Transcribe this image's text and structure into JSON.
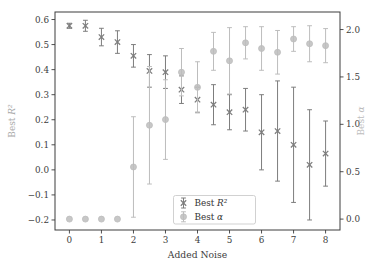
{
  "chart_data": {
    "type": "scatter",
    "style": "errorbar-dual-axis",
    "title": "",
    "xlabel": "Added Noise",
    "ylabel_left": "Best R²",
    "ylabel_right": "Best α",
    "x": [
      0,
      0.5,
      1,
      1.5,
      2,
      2.5,
      3,
      3.5,
      4,
      4.5,
      5,
      5.5,
      6,
      6.5,
      7,
      7.5,
      8
    ],
    "series": [
      {
        "name": "Best R²",
        "axis": "left",
        "marker": "x",
        "color": "#7d7d7d",
        "values": [
          0.575,
          0.575,
          0.53,
          0.51,
          0.455,
          0.395,
          0.39,
          0.32,
          0.28,
          0.26,
          0.23,
          0.24,
          0.15,
          0.155,
          0.1,
          0.02,
          0.065
        ],
        "errors": [
          0.01,
          0.022,
          0.035,
          0.045,
          0.045,
          0.065,
          0.065,
          0.055,
          0.05,
          0.08,
          0.07,
          0.085,
          0.15,
          0.2,
          0.23,
          0.22,
          0.13
        ]
      },
      {
        "name": "Best α",
        "axis": "right",
        "marker": "circle",
        "color": "#bdbdbd",
        "values": [
          0.0,
          0.0,
          0.0,
          0.0,
          0.55,
          0.99,
          1.05,
          1.55,
          1.39,
          1.77,
          1.67,
          1.86,
          1.8,
          1.76,
          1.9,
          1.85,
          1.83
        ],
        "errors": [
          0.0,
          0.0,
          0.0,
          0.0,
          0.53,
          0.62,
          0.42,
          0.25,
          0.27,
          0.2,
          0.35,
          0.17,
          0.23,
          0.23,
          0.13,
          0.19,
          0.18
        ]
      }
    ],
    "xlim": [
      -0.45,
      8.45
    ],
    "ylim_left": [
      -0.24,
      0.63
    ],
    "ylim_right": [
      -0.115,
      2.185
    ],
    "xticks": {
      "values": [
        0,
        1,
        2,
        3,
        4,
        5,
        6,
        7,
        8
      ],
      "labels": [
        "0",
        "1",
        "2",
        "3",
        "4",
        "5",
        "6",
        "7",
        "8"
      ]
    },
    "yticks_left": {
      "values": [
        0.6,
        0.5,
        0.4,
        0.3,
        0.2,
        0.1,
        0.0,
        -0.1,
        -0.2
      ],
      "labels": [
        "0.6",
        "0.5",
        "0.4",
        "0.3",
        "0.2",
        "0.1",
        "0.0",
        "−0.1",
        "−0.2"
      ]
    },
    "yticks_right": {
      "values": [
        0.0,
        0.5,
        1.0,
        1.5,
        2.0
      ],
      "labels": [
        "0.0",
        "0.5",
        "1.0",
        "1.5",
        "2.0"
      ]
    },
    "legend": {
      "position": "lower-center-right",
      "entries": [
        {
          "label": "Best R²",
          "marker": "x"
        },
        {
          "label": "Best α",
          "marker": "circle"
        }
      ]
    },
    "grid": false,
    "colors": {
      "spine": "#3c3c3c",
      "tick_label": "#3d3d3d",
      "xlabel": "#3d3d3d",
      "left_label": "#a9a9a9",
      "right_label": "#bdbdbd",
      "legend_border": "#cccccc",
      "legend_text": "#333333",
      "background": "#ffffff"
    }
  }
}
